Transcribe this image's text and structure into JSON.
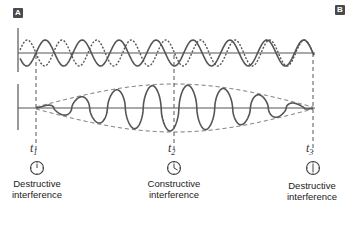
{
  "panels": {
    "a_label": "A",
    "b_label": "B"
  },
  "times": [
    {
      "symbol": "t",
      "subscript": "1",
      "caption_line1": "Destructive",
      "caption_line2": "interference"
    },
    {
      "symbol": "t",
      "subscript": "2",
      "caption_line1": "Constructive",
      "caption_line2": "interference"
    },
    {
      "symbol": "t",
      "subscript": "3",
      "caption_line1": "Destructive",
      "caption_line2": "interference"
    }
  ],
  "icons": {
    "clock": "clock-icon"
  },
  "colors": {
    "stroke": "#555555",
    "text": "#222222"
  }
}
